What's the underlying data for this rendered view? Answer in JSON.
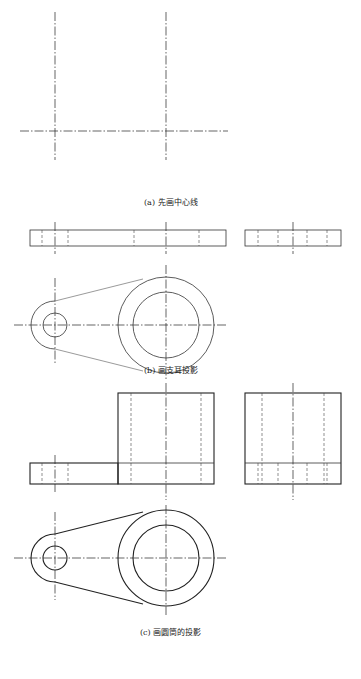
{
  "figure": {
    "panels": [
      {
        "id": "a",
        "caption": "(a) 先画中心线"
      },
      {
        "id": "b",
        "caption": "(b) 画支耳投影"
      },
      {
        "id": "c",
        "caption": "(c) 画圆筒的投影"
      }
    ]
  },
  "colors": {
    "line": "#222222",
    "background": "#ffffff"
  }
}
